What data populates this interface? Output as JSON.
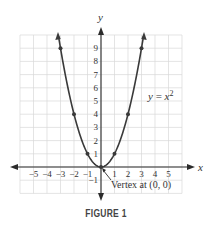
{
  "chart_data": {
    "type": "line",
    "title": "",
    "caption": "FIGURE 1",
    "function": "y = x^2",
    "xlabel": "x",
    "ylabel": "y",
    "xlim": [
      -6,
      6
    ],
    "ylim": [
      -2,
      10
    ],
    "grid": true,
    "x_ticks": [
      "−5",
      "−4",
      "−3",
      "−2",
      "−1",
      "1",
      "2",
      "3",
      "4",
      "5"
    ],
    "y_ticks": [
      "−1",
      "1",
      "2",
      "3",
      "4",
      "5",
      "6",
      "7",
      "8",
      "9"
    ],
    "series": [
      {
        "name": "y = x²",
        "x": [
          -3,
          -2,
          -1,
          0,
          1,
          2,
          3
        ],
        "values": [
          9,
          4,
          1,
          0,
          1,
          4,
          9
        ],
        "marked_points": [
          [
            -3,
            9
          ],
          [
            -2,
            4
          ],
          [
            -1,
            1
          ],
          [
            0,
            0
          ],
          [
            1,
            1
          ],
          [
            2,
            4
          ],
          [
            3,
            9
          ]
        ],
        "arrows_at_ends": true
      }
    ],
    "annotations": [
      {
        "text": "y = x²",
        "at": [
          4.2,
          5
        ]
      },
      {
        "text": "Vertex at (0, 0)",
        "points_to": [
          0,
          0
        ]
      }
    ]
  },
  "labels": {
    "x_axis": "x",
    "y_axis": "y",
    "equation_lhs": "y",
    "equation_eq": " = ",
    "equation_var": "x",
    "equation_exp": "2",
    "vertex_note": "Vertex at (0, 0)",
    "caption": "FIGURE 1"
  },
  "colors": {
    "grid": "#d9d9d9",
    "axis": "#2b2b2b",
    "curve": "#3a3a3a",
    "text": "#333333"
  }
}
